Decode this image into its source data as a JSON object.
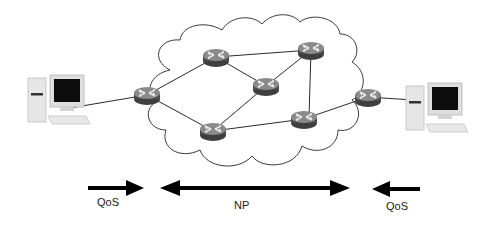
{
  "diagram": {
    "type": "network-topology",
    "colors": {
      "link": "#2a2a2a",
      "cloud": "#3a3a3a",
      "router_body": "#555555",
      "router_top": "#7a7a7a",
      "arrow": "#000000"
    },
    "hosts": [
      {
        "id": "host-left",
        "icon": "desktop-computer-icon",
        "x": 22,
        "y": 70
      },
      {
        "id": "host-right",
        "icon": "desktop-computer-icon",
        "x": 407,
        "y": 80
      }
    ],
    "routers": [
      {
        "id": "r1",
        "icon": "router-icon",
        "x": 147,
        "y": 95
      },
      {
        "id": "r2",
        "icon": "router-icon",
        "x": 216,
        "y": 57
      },
      {
        "id": "r3",
        "icon": "router-icon",
        "x": 311,
        "y": 50
      },
      {
        "id": "r4",
        "icon": "router-icon",
        "x": 266,
        "y": 86
      },
      {
        "id": "r5",
        "icon": "router-icon",
        "x": 213,
        "y": 131
      },
      {
        "id": "r6",
        "icon": "router-icon",
        "x": 304,
        "y": 119
      },
      {
        "id": "r7",
        "icon": "router-icon",
        "x": 368,
        "y": 97
      }
    ],
    "links": [
      [
        "host-left",
        "r1"
      ],
      [
        "r1",
        "r2"
      ],
      [
        "r1",
        "r5"
      ],
      [
        "r2",
        "r3"
      ],
      [
        "r2",
        "r4"
      ],
      [
        "r4",
        "r3"
      ],
      [
        "r4",
        "r5"
      ],
      [
        "r3",
        "r6"
      ],
      [
        "r5",
        "r6"
      ],
      [
        "r6",
        "r7"
      ],
      [
        "r7",
        "host-right"
      ]
    ],
    "cloud": {
      "label": "network-cloud"
    },
    "arrows": [
      {
        "id": "qos-left",
        "direction": "right",
        "label": "QoS"
      },
      {
        "id": "np",
        "direction": "both",
        "label": "NP"
      },
      {
        "id": "qos-right",
        "direction": "left",
        "label": "QoS"
      }
    ]
  }
}
